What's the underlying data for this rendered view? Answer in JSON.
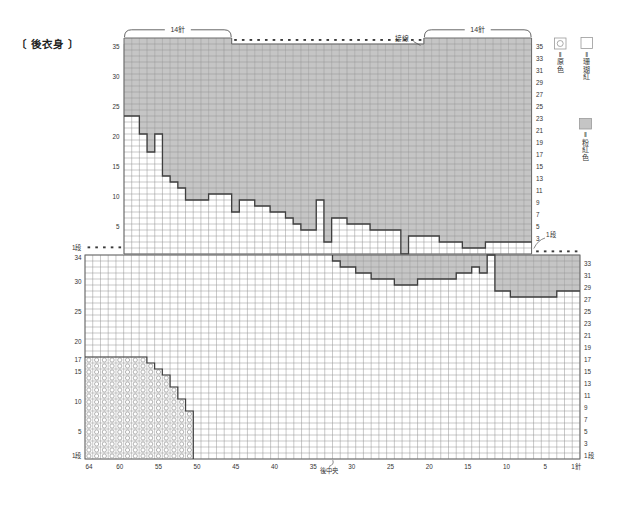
{
  "title": "〔 後衣身 〕",
  "colors": {
    "background": "#ffffff",
    "contrast_fill": "#c5c5c5",
    "grid_line": "#939393",
    "panel_border": "#6a6a6a",
    "boundary_line": "#3f3f3f",
    "ring_stroke": "#a0a0a0",
    "dot": "#3a3a3a",
    "text": "#333333"
  },
  "legend": [
    {
      "symbol": "circle-in-square",
      "chars": [
        "‖",
        "原",
        "色"
      ],
      "label": "=原色"
    },
    {
      "symbol": "white-square",
      "chars": [
        "‖",
        "珊",
        "瑚",
        "紅"
      ],
      "label": "=珊瑚紅"
    },
    {
      "symbol": "gray-square",
      "chars": [
        "‖",
        "粉",
        "紅",
        "色"
      ],
      "label": "=粉紅色"
    }
  ],
  "chart_data": {
    "type": "heatmap",
    "upper_panel": {
      "cols": 53,
      "rows": 35,
      "raised_top_row_col_ranges": [
        [
          1,
          14
        ],
        [
          40,
          53
        ]
      ],
      "bracket_label_left": "14針",
      "bracket_label_right": "14針",
      "join_label": "接線",
      "gray_bottom_row": [
        24,
        24,
        21,
        18,
        21,
        14,
        13,
        12,
        10,
        10,
        10,
        11,
        11,
        11,
        8,
        10,
        10,
        9,
        9,
        8,
        8,
        7,
        6,
        5,
        5,
        10,
        3,
        7,
        7,
        6,
        6,
        6,
        5,
        5,
        5,
        5,
        1,
        4,
        4,
        4,
        4,
        3,
        3,
        3,
        2,
        2,
        2,
        3,
        3,
        3,
        3,
        3,
        3
      ],
      "left_axis_rows": [
        35,
        30,
        25,
        20,
        15,
        10,
        5
      ],
      "right_axis_rows": [
        35,
        33,
        31,
        29,
        27,
        25,
        23,
        21,
        19,
        17,
        15,
        13,
        11,
        9,
        7,
        5,
        3
      ],
      "right_axis_row1_label": "1段",
      "dotted_top_cols": [
        15,
        39
      ]
    },
    "lower_panel": {
      "cols": 64,
      "rows": 34,
      "gray_bottom_row": [
        0,
        0,
        0,
        0,
        0,
        0,
        0,
        0,
        0,
        0,
        0,
        0,
        0,
        0,
        0,
        0,
        0,
        0,
        0,
        0,
        0,
        0,
        0,
        0,
        0,
        0,
        0,
        0,
        0,
        0,
        0,
        0,
        34,
        33,
        33,
        32,
        32,
        31,
        31,
        31,
        30,
        30,
        30,
        31,
        31,
        31,
        31,
        31,
        32,
        32,
        33,
        32,
        0,
        29,
        29,
        28,
        28,
        28,
        28,
        28,
        28,
        29,
        29,
        29
      ],
      "circle_top_row": [
        17,
        17,
        17,
        17,
        17,
        17,
        17,
        17,
        16,
        15,
        14,
        12,
        10,
        8
      ],
      "left_axis_top_label": "1段",
      "left_axis_rows": [
        34,
        30,
        25,
        20,
        17,
        15,
        10,
        5
      ],
      "left_axis_bottom_label": "1段",
      "right_axis_rows": [
        33,
        31,
        29,
        27,
        25,
        23,
        21,
        19,
        17,
        15,
        13,
        11,
        9,
        7,
        5,
        3
      ],
      "right_axis_row1_label": "1段",
      "bottom_axis_stitches": [
        64,
        60,
        55,
        50,
        45,
        40,
        35,
        30,
        25,
        20,
        15,
        10,
        5,
        1
      ],
      "bottom_axis_labels": [
        "64",
        "60",
        "55",
        "50",
        "45",
        "40",
        "35",
        "30",
        "25",
        "20",
        "15",
        "10",
        "5",
        "1針"
      ],
      "center_label": "後中央",
      "dotted_top_left_cols": 5,
      "dotted_top_right_cols": 6
    }
  }
}
